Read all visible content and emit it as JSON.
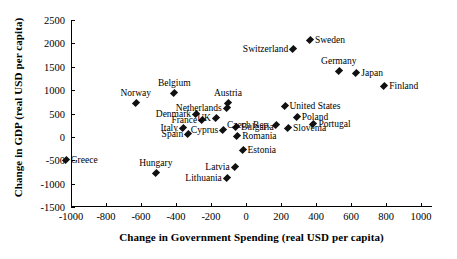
{
  "chart_data": {
    "type": "scatter",
    "title": "",
    "xlabel": "Change in Government Spending (real USD per capita)",
    "ylabel": "Change in GDP (real USD per capita)",
    "xlim": [
      -1100,
      1050
    ],
    "ylim": [
      -1500,
      2500
    ],
    "xticks": [
      -1000,
      -800,
      -600,
      -400,
      -200,
      0,
      200,
      400,
      600,
      800,
      1000
    ],
    "xticklabels": [
      "-1000",
      "-800",
      "-600",
      "-400",
      "-200",
      "0",
      "200",
      "400",
      "600",
      "800",
      "1000"
    ],
    "yticks": [
      -1500,
      -1000,
      -500,
      0,
      500,
      1000,
      1500,
      2000,
      2500
    ],
    "yticklabels": [
      "-1500",
      "-1000",
      "-500",
      "0",
      "500",
      "1000",
      "1500",
      "2000",
      "2500"
    ],
    "grid": false,
    "legend": null,
    "marker_color": "#111111",
    "marker_shape": "diamond",
    "points": [
      {
        "label": "Greece",
        "x": -1030,
        "y": -500,
        "label_pos": "right"
      },
      {
        "label": "Norway",
        "x": -630,
        "y": 730,
        "label_pos": "top"
      },
      {
        "label": "Belgium",
        "x": -410,
        "y": 940,
        "label_pos": "top"
      },
      {
        "label": "Denmark",
        "x": -285,
        "y": 500,
        "label_pos": "left"
      },
      {
        "label": "Italy",
        "x": -360,
        "y": 180,
        "label_pos": "left"
      },
      {
        "label": "Spain",
        "x": -330,
        "y": 60,
        "label_pos": "left"
      },
      {
        "label": "Hungary",
        "x": -515,
        "y": -775,
        "label_pos": "top"
      },
      {
        "label": "France",
        "x": -250,
        "y": 355,
        "label_pos": "left"
      },
      {
        "label": "UK",
        "x": -172,
        "y": 400,
        "label_pos": "left"
      },
      {
        "label": "Cyprus",
        "x": -130,
        "y": 145,
        "label_pos": "left"
      },
      {
        "label": "Netherlands",
        "x": -110,
        "y": 620,
        "label_pos": "left"
      },
      {
        "label": "Austria",
        "x": -103,
        "y": 720,
        "label_pos": "top"
      },
      {
        "label": "Bulgaria",
        "x": -57,
        "y": 205,
        "label_pos": "right"
      },
      {
        "label": "Romania",
        "x": -50,
        "y": 10,
        "label_pos": "right"
      },
      {
        "label": "Lithuania",
        "x": -110,
        "y": -880,
        "label_pos": "left"
      },
      {
        "label": "Latvia",
        "x": -65,
        "y": -640,
        "label_pos": "left"
      },
      {
        "label": "Estonia",
        "x": -20,
        "y": -290,
        "label_pos": "right"
      },
      {
        "label": "Czech Rep.",
        "x": 170,
        "y": 255,
        "label_pos": "left"
      },
      {
        "label": "United States",
        "x": 220,
        "y": 660,
        "label_pos": "right"
      },
      {
        "label": "Poland",
        "x": 290,
        "y": 415,
        "label_pos": "right"
      },
      {
        "label": "Slovenia",
        "x": 240,
        "y": 180,
        "label_pos": "right"
      },
      {
        "label": "Portugal",
        "x": 385,
        "y": 275,
        "label_pos": "right"
      },
      {
        "label": "Switzerland",
        "x": 270,
        "y": 1880,
        "label_pos": "left"
      },
      {
        "label": "Sweden",
        "x": 365,
        "y": 2075,
        "label_pos": "right"
      },
      {
        "label": "Germany",
        "x": 530,
        "y": 1415,
        "label_pos": "top"
      },
      {
        "label": "Japan",
        "x": 630,
        "y": 1360,
        "label_pos": "right"
      },
      {
        "label": "Finland",
        "x": 790,
        "y": 1080,
        "label_pos": "right"
      }
    ]
  }
}
